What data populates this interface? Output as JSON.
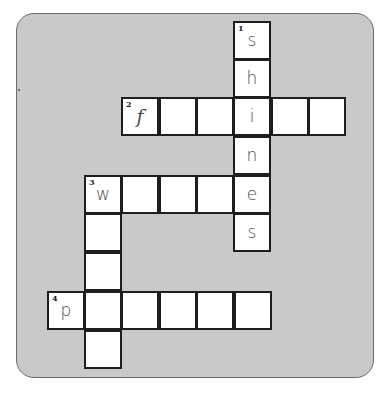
{
  "puzzle": {
    "type": "crossword",
    "colors": {
      "panel": "#c9c9c9",
      "panel_border": "#6a6a6a",
      "cell": "#ffffff",
      "cell_border": "#1e1e1e",
      "letter": "#4a4a4a"
    },
    "cells": [
      {
        "x": 233,
        "y": 21,
        "letter": "s",
        "number": "1"
      },
      {
        "x": 233,
        "y": 59,
        "letter": "h",
        "number": ""
      },
      {
        "x": 121,
        "y": 97,
        "letter": "f",
        "number": "2"
      },
      {
        "x": 159,
        "y": 97,
        "letter": "",
        "number": ""
      },
      {
        "x": 196,
        "y": 97,
        "letter": "",
        "number": ""
      },
      {
        "x": 233,
        "y": 97,
        "letter": "i",
        "number": ""
      },
      {
        "x": 271,
        "y": 97,
        "letter": "",
        "number": ""
      },
      {
        "x": 308,
        "y": 97,
        "letter": "",
        "number": ""
      },
      {
        "x": 233,
        "y": 136,
        "letter": "n",
        "number": ""
      },
      {
        "x": 84,
        "y": 175,
        "letter": "w",
        "number": "3"
      },
      {
        "x": 121,
        "y": 175,
        "letter": "",
        "number": ""
      },
      {
        "x": 159,
        "y": 175,
        "letter": "",
        "number": ""
      },
      {
        "x": 196,
        "y": 175,
        "letter": "",
        "number": ""
      },
      {
        "x": 233,
        "y": 175,
        "letter": "e",
        "number": ""
      },
      {
        "x": 233,
        "y": 213,
        "letter": "s",
        "number": ""
      },
      {
        "x": 84,
        "y": 213,
        "letter": "",
        "number": ""
      },
      {
        "x": 84,
        "y": 252,
        "letter": "",
        "number": ""
      },
      {
        "x": 47,
        "y": 291,
        "letter": "p",
        "number": "4"
      },
      {
        "x": 84,
        "y": 291,
        "letter": "",
        "number": ""
      },
      {
        "x": 121,
        "y": 291,
        "letter": "",
        "number": ""
      },
      {
        "x": 159,
        "y": 291,
        "letter": "",
        "number": ""
      },
      {
        "x": 196,
        "y": 291,
        "letter": "",
        "number": ""
      },
      {
        "x": 234,
        "y": 291,
        "letter": "",
        "number": ""
      },
      {
        "x": 84,
        "y": 330,
        "letter": "",
        "number": ""
      }
    ],
    "words": [
      {
        "number": "1",
        "direction": "down",
        "length": 6,
        "known": "shines"
      },
      {
        "number": "2",
        "direction": "across",
        "length": 6,
        "known": "f _ _ i _ _"
      },
      {
        "number": "3",
        "direction": "across",
        "length": 5,
        "known": "w _ _ _ e"
      },
      {
        "number": "3",
        "direction": "down",
        "length": 5,
        "known": "w _ _ _ _"
      },
      {
        "number": "4",
        "direction": "across",
        "length": 6,
        "known": "p _ _ _ _ _"
      }
    ]
  }
}
